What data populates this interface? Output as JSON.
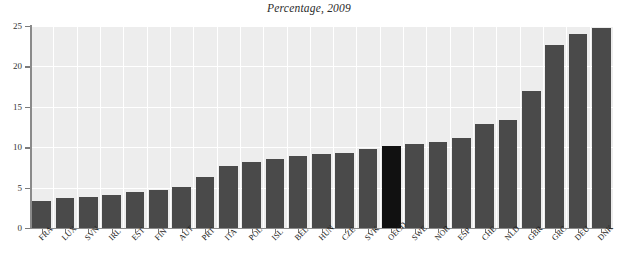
{
  "chart_data": {
    "type": "bar",
    "title": "Percentage, 2009",
    "xlabel": "",
    "ylabel": "",
    "ylim": [
      0,
      25
    ],
    "yticks": [
      0,
      5,
      10,
      15,
      20,
      25
    ],
    "ytick_labels": [
      "0",
      "5",
      "10",
      "15",
      "20",
      "25"
    ],
    "grid": true,
    "legend": null,
    "highlight_category": "OECD",
    "categories": [
      "FRA",
      "LUX",
      "SVN",
      "IRL",
      "EST",
      "FIN",
      "AUT",
      "PRT",
      "ITA",
      "POL",
      "ISL",
      "BEL",
      "HUN",
      "CZE",
      "SVK",
      "OECD",
      "SWE",
      "NOR",
      "ESP",
      "CHE",
      "NLD",
      "GBR",
      "GRC",
      "DEU",
      "DNK"
    ],
    "values": [
      3.4,
      3.7,
      3.9,
      4.1,
      4.4,
      4.7,
      5.1,
      6.3,
      7.7,
      8.2,
      8.6,
      8.9,
      9.2,
      9.3,
      9.8,
      10.2,
      10.4,
      10.6,
      11.2,
      12.9,
      13.4,
      17.0,
      22.6,
      24.0,
      24.8
    ],
    "colors": {
      "bar": "#4a4a4a",
      "bar_highlight": "#111111",
      "plot_background": "#ededed",
      "gridline": "#ffffff",
      "axis": "#8a8a8a",
      "text": "#1c1c1c"
    }
  }
}
